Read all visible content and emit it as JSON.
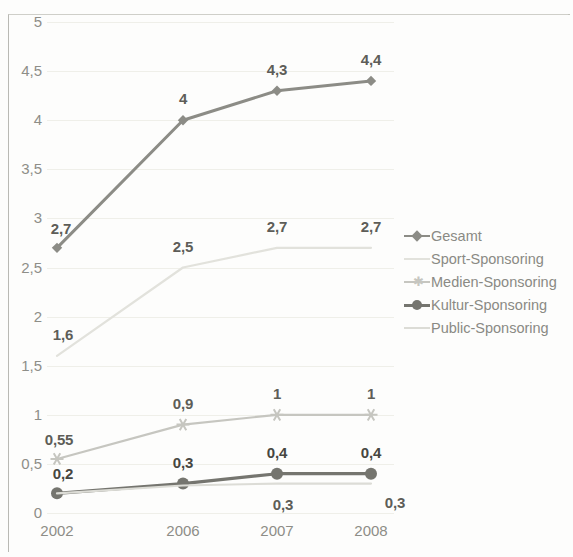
{
  "chart_data": {
    "type": "line",
    "title": "",
    "subtitle": "",
    "xlabel": "",
    "ylabel": "",
    "categories": [
      "2002",
      "2006",
      "2007",
      "2008"
    ],
    "ylim": [
      0,
      5
    ],
    "ytick_labels": [
      "0",
      "0,5",
      "1",
      "1,5",
      "2",
      "2,5",
      "3",
      "3,5",
      "4",
      "4,5",
      "5"
    ],
    "ytick_values": [
      0,
      0.5,
      1,
      1.5,
      2,
      2.5,
      3,
      3.5,
      4,
      4.5,
      5
    ],
    "grid": true,
    "legend_position": "right",
    "series": [
      {
        "name": "Gesamt",
        "values": [
          2.7,
          4,
          4.3,
          4.4
        ],
        "labels": [
          "2,7",
          "4",
          "4,3",
          "4,4"
        ],
        "color": "#8c8c86",
        "marker": "diamond",
        "label_color": "#5d5d58"
      },
      {
        "name": "Sport-Sponsoring",
        "values": [
          1.6,
          2.5,
          2.7,
          2.7
        ],
        "labels": [
          "1,6",
          "2,5",
          "2,7",
          "2,7"
        ],
        "color": "#e2e2dc",
        "marker": "none",
        "label_color": "#5d5d58"
      },
      {
        "name": "Medien-Sponsoring",
        "values": [
          0.55,
          0.9,
          1,
          1
        ],
        "labels": [
          "0,55",
          "0,9",
          "1",
          "1"
        ],
        "color": "#c6c6c0",
        "marker": "star",
        "label_color": "#5d5d58"
      },
      {
        "name": "Kultur-Sponsoring",
        "values": [
          0.2,
          0.3,
          0.4,
          0.4
        ],
        "labels": [
          "0,2",
          "0,3",
          "0,4",
          "0,4"
        ],
        "color": "#75756f",
        "marker": "circle",
        "label_color": "#464641"
      },
      {
        "name": "Public-Sponsoring",
        "values": [
          0.2,
          0.28,
          0.3,
          0.3
        ],
        "labels": [
          "",
          "",
          "0,3",
          "0,3"
        ],
        "color": "#dcdcd6",
        "marker": "none",
        "label_color": "#5d5d58"
      }
    ]
  },
  "legend": {
    "items": [
      {
        "label": "Gesamt",
        "key": "diamond-line-key"
      },
      {
        "label": "Sport-Sponsoring",
        "key": "faint-line-key"
      },
      {
        "label": "Medien-Sponsoring",
        "key": "star-line-key"
      },
      {
        "label": "Kultur-Sponsoring",
        "key": "circle-line-key"
      },
      {
        "label": "Public-Sponsoring",
        "key": "dashed-line-key"
      }
    ]
  },
  "axes": {
    "x_labels": [
      "2002",
      "2006",
      "2007",
      "2008"
    ],
    "y_labels": [
      "5",
      "4,5",
      "4",
      "3,5",
      "3",
      "2,5",
      "2",
      "1,5",
      "1",
      "0,5",
      "0"
    ]
  }
}
